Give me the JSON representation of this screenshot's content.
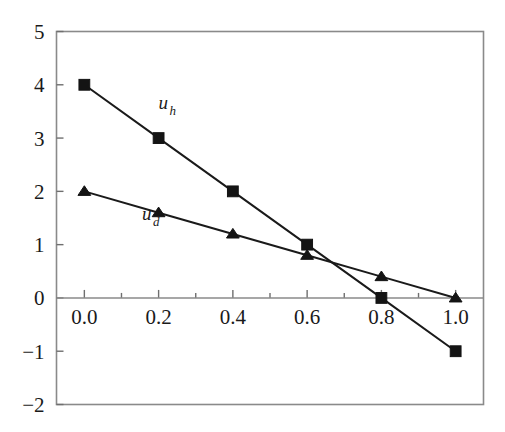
{
  "figure": {
    "background_color": "#ffffff",
    "frame_color": "#8a8a8a",
    "ink_color": "#1a1a1a"
  },
  "chart_data": {
    "type": "line",
    "title": "",
    "subtitle": "",
    "xlabel": "",
    "ylabel": "",
    "x": [
      0.0,
      0.2,
      0.4,
      0.6,
      0.8,
      1.0
    ],
    "series": [
      {
        "name": "u_h",
        "label_text": "u",
        "label_sub": "h",
        "marker": "square",
        "values": [
          4.0,
          3.0,
          2.0,
          1.0,
          0.0,
          -1.0
        ],
        "color": "#141414"
      },
      {
        "name": "u_d",
        "label_text": "u",
        "label_sub": "d",
        "marker": "triangle",
        "values": [
          2.0,
          1.6,
          1.2,
          0.8,
          0.4,
          0.0
        ],
        "color": "#141414"
      }
    ],
    "xlim": [
      -0.075,
      1.075
    ],
    "ylim": [
      -2,
      5
    ],
    "xticks": [
      0.0,
      0.2,
      0.4,
      0.6,
      0.8,
      1.0
    ],
    "xtick_labels": [
      "0.0",
      "0.2",
      "0.4",
      "0.6",
      "0.8",
      "1.0"
    ],
    "xminor_ticks": [
      0.1,
      0.3,
      0.5,
      0.7,
      0.9
    ],
    "yticks": [
      5,
      4,
      3,
      2,
      1,
      0,
      -1,
      -2
    ],
    "ytick_labels": [
      "5",
      "4",
      "3",
      "2",
      "1",
      "0",
      "−1",
      "−2"
    ],
    "grid": false,
    "legend": "inline-annotations",
    "zero_line": true
  },
  "annotations": [
    {
      "name": "label-uh",
      "text": "u",
      "sub": "h",
      "x": 0.2,
      "y": 3.55
    },
    {
      "name": "label-ud",
      "text": "u",
      "sub": "d",
      "x": 0.155,
      "y": 1.47
    }
  ],
  "axes": {
    "y_labels": [
      "5",
      "4",
      "3",
      "2",
      "1",
      "0",
      "−1",
      "−2"
    ],
    "x_labels": [
      "0.0",
      "0.2",
      "0.4",
      "0.6",
      "0.8",
      "1.0"
    ]
  }
}
